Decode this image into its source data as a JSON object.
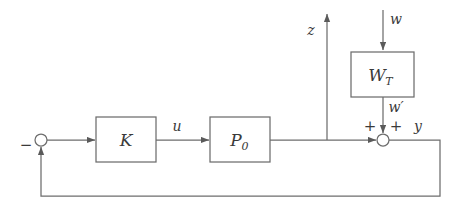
{
  "figure": {
    "kind": "control-block-diagram",
    "title": "",
    "background_color": "#ffffff",
    "line_color": "#6d6d6d",
    "text_color": "#3a3a3a"
  },
  "blocks": [
    {
      "id": "controller",
      "label": "K",
      "subscript": "",
      "x": 96,
      "y": 117,
      "width": 60,
      "height": 45
    },
    {
      "id": "plant",
      "label": "P",
      "subscript": "0",
      "x": 210,
      "y": 117,
      "width": 60,
      "height": 45
    },
    {
      "id": "weight",
      "label": "W",
      "subscript": "T",
      "x": 351,
      "y": 52,
      "width": 63,
      "height": 45
    }
  ],
  "junctions": [
    {
      "id": "error-sum",
      "cx": 41,
      "cy": 140,
      "r": 6
    },
    {
      "id": "output-sum",
      "cx": 383,
      "cy": 140,
      "r": 6
    }
  ],
  "signals": {
    "minus": "−",
    "u": "u",
    "z": "z",
    "w": "w",
    "w_prime": "w′",
    "y": "y",
    "plus_left": "+",
    "plus_right": "+"
  },
  "labels": {
    "minus_sign": "−",
    "control_signal": "u",
    "performance_output": "z",
    "disturbance_input": "w",
    "weighted_disturbance": "w′",
    "measured_output": "y",
    "sum_plus_left": "+",
    "sum_plus_right": "+",
    "controller_name": "K",
    "plant_name": "P",
    "plant_sub": "0",
    "weight_name": "W",
    "weight_sub": "T"
  }
}
